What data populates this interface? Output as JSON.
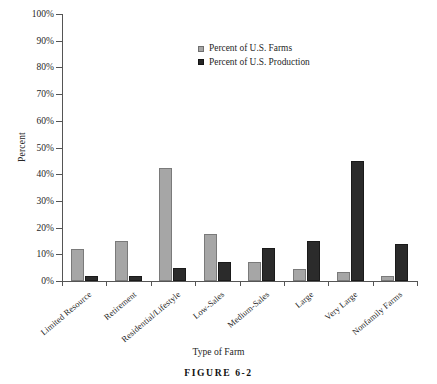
{
  "chart_data": {
    "type": "bar",
    "title": "",
    "categories": [
      "Limited Resource",
      "Retirement",
      "Residential/Lifestyle",
      "Low-Sales",
      "Medium-Sales",
      "Large",
      "Very Large",
      "Nonfamily Farms"
    ],
    "series": [
      {
        "name": "Percent of U.S. Farms",
        "color": "#a6a6a6",
        "values": [
          12,
          15,
          42.5,
          17.5,
          7,
          4.5,
          3.5,
          2
        ]
      },
      {
        "name": "Percent of U.S. Production",
        "color": "#262626",
        "values": [
          2,
          2,
          5,
          7,
          12.5,
          15,
          45,
          14
        ]
      }
    ],
    "xlabel": "Type of Farm",
    "ylabel": "Percent",
    "ylim": [
      0,
      100
    ],
    "yticks": [
      0,
      10,
      20,
      30,
      40,
      50,
      60,
      70,
      80,
      90,
      100
    ],
    "ytick_labels": [
      "0%",
      "10%",
      "20%",
      "30%",
      "40%",
      "50%",
      "60%",
      "70%",
      "80%",
      "90%",
      "100%"
    ],
    "grid": false,
    "legend_position": "top-center"
  },
  "caption": {
    "figure_label": "FIGURE 6-2"
  }
}
